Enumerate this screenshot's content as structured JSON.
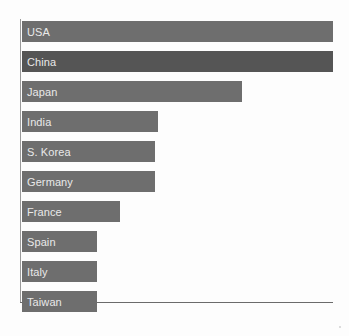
{
  "chart": {
    "type": "bar",
    "orientation": "horizontal",
    "title": "",
    "xlabel": "",
    "ylabel": "",
    "background_color": "#fdfdfd",
    "axis_color": "#6b6b6b",
    "label_color": "#e9e9e9",
    "bar_color_default": "#6e6e6e",
    "bar_color_highlight": "#555555",
    "grid": false,
    "legend": "none"
  },
  "chart_data": {
    "type": "bar",
    "orientation": "horizontal",
    "title": "",
    "xlabel": "",
    "ylabel": "",
    "grid": false,
    "legend": "none",
    "xlim": [
      0,
      100
    ],
    "categories": [
      "USA",
      "China",
      "Japan",
      "India",
      "S. Korea",
      "Germany",
      "France",
      "Spain",
      "Italy",
      "Taiwan"
    ],
    "values": [
      100,
      100,
      71,
      44,
      43,
      43,
      32,
      24,
      24,
      24
    ],
    "colors": [
      "#6e6e6e",
      "#555555",
      "#6e6e6e",
      "#6e6e6e",
      "#6e6e6e",
      "#6e6e6e",
      "#6e6e6e",
      "#6e6e6e",
      "#6e6e6e",
      "#6e6e6e"
    ],
    "bars": [
      {
        "label": "USA",
        "value": 100,
        "pct": 100.0,
        "color": "#6e6e6e"
      },
      {
        "label": "China",
        "value": 100,
        "pct": 100.0,
        "color": "#555555"
      },
      {
        "label": "Japan",
        "value": 71,
        "pct": 70.8,
        "color": "#6e6e6e"
      },
      {
        "label": "India",
        "value": 44,
        "pct": 43.7,
        "color": "#6e6e6e"
      },
      {
        "label": "S. Korea",
        "value": 43,
        "pct": 42.8,
        "color": "#6e6e6e"
      },
      {
        "label": "Germany",
        "value": 43,
        "pct": 42.8,
        "color": "#6e6e6e"
      },
      {
        "label": "France",
        "value": 32,
        "pct": 31.5,
        "color": "#6e6e6e"
      },
      {
        "label": "Spain",
        "value": 24,
        "pct": 24.1,
        "color": "#6e6e6e"
      },
      {
        "label": "Italy",
        "value": 24,
        "pct": 24.1,
        "color": "#6e6e6e"
      },
      {
        "label": "Taiwan",
        "value": 24,
        "pct": 24.1,
        "color": "#6e6e6e"
      }
    ]
  }
}
